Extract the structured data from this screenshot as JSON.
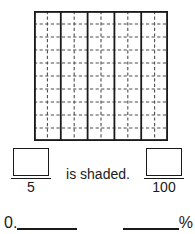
{
  "worksheet": {
    "grid": {
      "name": "hundredths-grid",
      "rows": 10,
      "columns": 10,
      "group_columns": 5,
      "cells_per_group_horizontal": 2,
      "shaded_cells": 0,
      "line_color": "#1a1a1a",
      "cell_fill": "#ffffff",
      "solid_line_color": "#1a1a1a",
      "dashed_line_color": "#4d4d4d"
    },
    "fraction_left": {
      "numerator_value": "",
      "numerator_placeholder": "",
      "denominator": "5"
    },
    "fraction_right": {
      "numerator_value": "",
      "numerator_placeholder": "",
      "denominator": "100"
    },
    "shaded_label": "is shaded.",
    "decimal_answer": {
      "prefix": "0.",
      "value": ""
    },
    "percent_answer": {
      "value": "",
      "suffix": "%"
    }
  }
}
